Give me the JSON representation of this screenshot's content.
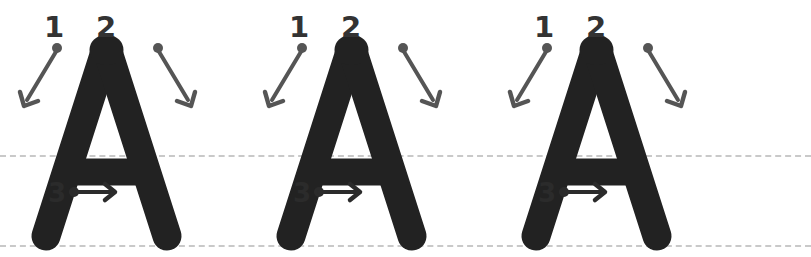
{
  "page": {
    "background_color": "#ffffff",
    "letter": "A",
    "repetitions": 3
  },
  "colors": {
    "letter_fill": "#222222",
    "arrow": "#555555",
    "number": "#333333",
    "guideline": "#c9c9c9",
    "background": "#ffffff"
  },
  "guidelines": [
    {
      "name": "midline",
      "y": 155,
      "style": "dashed"
    },
    {
      "name": "baseline",
      "y": 245,
      "style": "dashed"
    }
  ],
  "strokes": [
    {
      "number": "1",
      "label": "1",
      "direction": "down-left diagonal",
      "arrow": "diagonal-down-left-arrow"
    },
    {
      "number": "2",
      "label": "2",
      "direction": "down-right diagonal",
      "arrow": "diagonal-down-right-arrow"
    },
    {
      "number": "3",
      "label": "3",
      "direction": "horizontal right",
      "arrow": "horizontal-right-arrow"
    }
  ],
  "letters": [
    {
      "index": 1,
      "char": "A",
      "x": 0
    },
    {
      "index": 2,
      "char": "A",
      "x": 245
    },
    {
      "index": 3,
      "char": "A",
      "x": 490
    }
  ]
}
